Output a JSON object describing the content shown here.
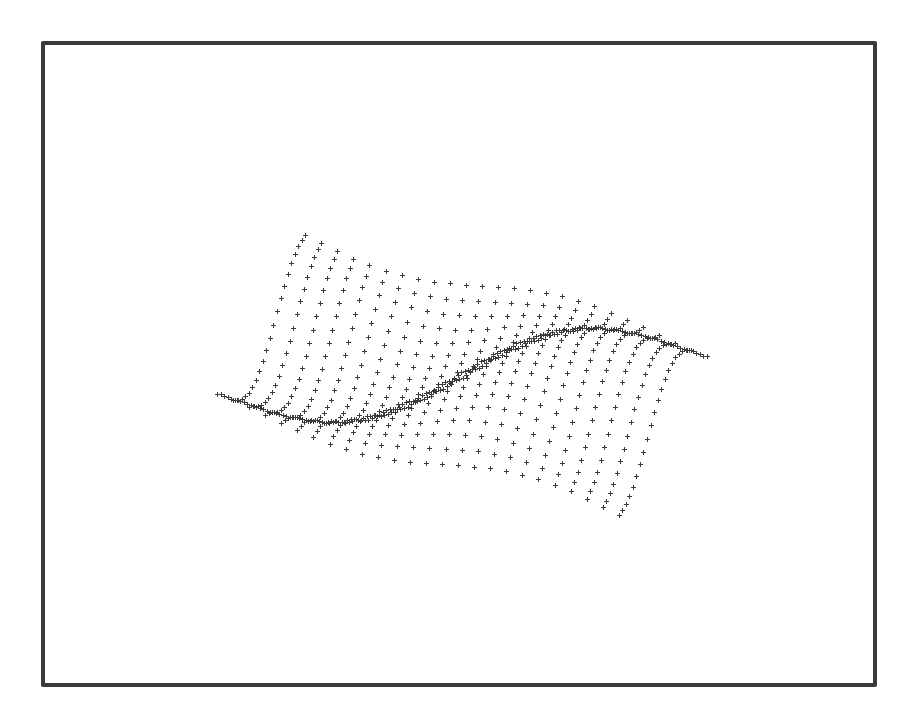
{
  "chart_data": {
    "type": "scatter",
    "title": "",
    "xlabel": "",
    "ylabel": "",
    "zlabel": "",
    "grid": false,
    "legend": null,
    "marker": "+",
    "surface": {
      "grid_size": [
        26,
        26
      ],
      "x_range": [
        -1,
        1
      ],
      "y_range": [
        -1,
        1
      ],
      "function": "0.55*sin(2.6*x + 1.2*y) * cos(1.6*y - 0.4*x)"
    },
    "projection": {
      "center_px": [
        462,
        375
      ],
      "scale_x": 245,
      "scale_y": 95,
      "skew": 0.42,
      "z_scale": 120
    },
    "colors": {
      "marker": "#3c3c3c",
      "frame": "#3a3a3a",
      "background": "#ffffff"
    },
    "approx_extent_px": {
      "x_min": 206,
      "x_max": 716,
      "y_min": 200,
      "y_max": 548
    }
  }
}
